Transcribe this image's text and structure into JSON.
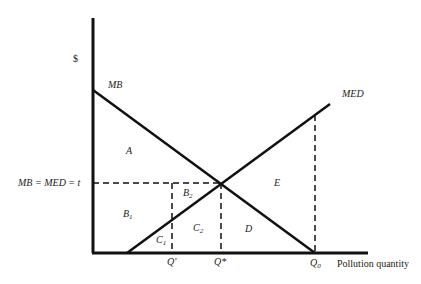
{
  "diagram": {
    "y_axis_label": "$",
    "x_axis_label": "Pollution quantity",
    "curves": {
      "mb": "MB",
      "med": "MED"
    },
    "equilibrium_label": "MB = MED = t",
    "quantities": {
      "q_prime": "Q'",
      "q_star": "Q*",
      "q0": "Q",
      "q0_sub": "0"
    },
    "regions": {
      "a": "A",
      "b1": "B",
      "b1_sub": "1",
      "b2": "B",
      "b2_sub": "2",
      "c1": "C",
      "c1_sub": "1",
      "c2": "C",
      "c2_sub": "2",
      "d": "D",
      "e": "E"
    },
    "colors": {
      "line": "#111111",
      "text": "#222222",
      "background": "#ffffff"
    }
  }
}
